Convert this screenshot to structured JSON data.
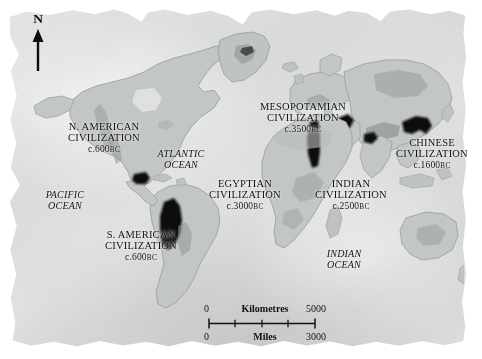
{
  "map": {
    "title": "Early World Civilizations",
    "orientation": {
      "label": "N",
      "icon": "north-arrow-icon"
    },
    "civilizations": [
      {
        "id": "n-american",
        "line1": "N. AMERICAN",
        "line2": "CIVILIZATION",
        "date": "c.600",
        "era": "BC"
      },
      {
        "id": "s-american",
        "line1": "S. AMERICAN",
        "line2": "CIVILIZATION",
        "date": "c.600",
        "era": "BC"
      },
      {
        "id": "mesopotamian",
        "line1": "MESOPOTAMIAN",
        "line2": "CIVILIZATION",
        "date": "c.3500",
        "era": "BC"
      },
      {
        "id": "egyptian",
        "line1": "EGYPTIAN",
        "line2": "CIVILIZATION",
        "date": "c.3000",
        "era": "BC"
      },
      {
        "id": "indian",
        "line1": "INDIAN",
        "line2": "CIVILIZATION",
        "date": "c.2500",
        "era": "BC"
      },
      {
        "id": "chinese",
        "line1": "CHINESE",
        "line2": "CIVILIZATION",
        "date": "c.1600",
        "era": "BC"
      }
    ],
    "oceans": [
      {
        "id": "pacific",
        "line1": "PACIFIC",
        "line2": "OCEAN"
      },
      {
        "id": "atlantic",
        "line1": "ATLANTIC",
        "line2": "OCEAN"
      },
      {
        "id": "indian",
        "line1": "INDIAN",
        "line2": "OCEAN"
      }
    ],
    "scale": {
      "kilometres": {
        "zero": "0",
        "unit": "Kilometres",
        "max": "5000"
      },
      "miles": {
        "zero": "0",
        "unit": "Miles",
        "max": "3000"
      }
    },
    "colors": {
      "parchment": "#e3e4e3",
      "land": "#c2c6c3",
      "land_edge": "#9aa09c",
      "civ_patch": "#0e0e0e",
      "highland": "#8e9491",
      "text": "#121212"
    }
  }
}
